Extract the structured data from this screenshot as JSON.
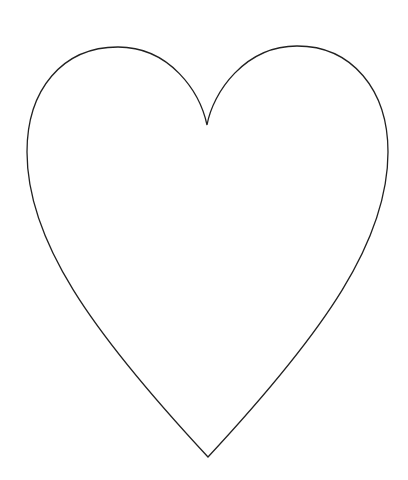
{
  "image": {
    "subject": "heart outline",
    "background_color": "#ffffff",
    "fill_color": "#ffffff",
    "stroke_color": "#222222",
    "stroke_width": 1.3
  },
  "heart_shape": {
    "left_lobe_top": [
      118,
      47
    ],
    "right_lobe_top": [
      297,
      46
    ],
    "top_cusp": [
      207,
      125
    ],
    "leftmost_point": [
      27,
      152
    ],
    "rightmost_point": [
      388,
      152
    ],
    "bottom_tip": [
      208,
      457
    ]
  }
}
